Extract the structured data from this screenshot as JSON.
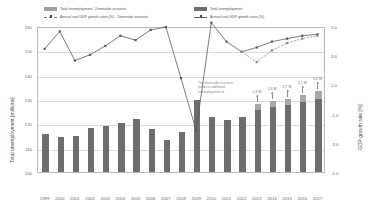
{
  "legend": {
    "left": [
      {
        "key": "bar-light",
        "label": "Total unemployment - Downside scenario"
      },
      {
        "key": "line-dashed",
        "label": "Annual real GDP growth rates (%) - Downside scenario"
      }
    ],
    "right": [
      {
        "key": "bar-dark",
        "label": "Total unemployment"
      },
      {
        "key": "line-solid",
        "label": "Annual real GDP growth rates (%)"
      }
    ]
  },
  "annotation": "The downside scenario predicts additional unemployment of",
  "chart_data": {
    "type": "bar",
    "title": "",
    "xlabel": "",
    "ylabel": "Total unemployment [millions]",
    "y2label": "GDP growth rate [%]",
    "categories": [
      "1999",
      "2000",
      "2001",
      "2002",
      "2003",
      "2004",
      "2005",
      "2006",
      "2007",
      "2008",
      "2009",
      "2010",
      "2011",
      "2012",
      "2013",
      "2014",
      "2015",
      "2016",
      "2017"
    ],
    "ylim": [
      100,
      160
    ],
    "yticks": [
      100,
      110,
      120,
      130,
      140,
      150,
      160
    ],
    "y2lim": [
      -5.0,
      5.0
    ],
    "y2ticks": [
      5.0,
      3.0,
      1.0,
      -1.0,
      -3.0,
      -5.0
    ],
    "grid": true,
    "legend_position": "top",
    "series": [
      {
        "name": "Total unemployment",
        "type": "bar",
        "axis": "left",
        "color": "#6d6d6d",
        "values": [
          115.5,
          114.4,
          114.8,
          118.2,
          119.0,
          120.0,
          121.6,
          117.5,
          113.0,
          116.3,
          129.6,
          122.8,
          121.2,
          122.5,
          126.4,
          127.4,
          128.3,
          129.5,
          130.9
        ]
      },
      {
        "name": "Total unemployment - Downside scenario",
        "type": "bar-increment",
        "axis": "left",
        "color": "#a8a8a8",
        "values": [
          null,
          null,
          null,
          null,
          null,
          null,
          null,
          null,
          null,
          null,
          null,
          null,
          null,
          null,
          2.4,
          2.6,
          2.7,
          3.1,
          3.2
        ]
      },
      {
        "name": "Annual real GDP growth rates (%)",
        "type": "line",
        "axis": "right",
        "color": "#5a5a5a",
        "values": [
          3.5,
          4.7,
          2.7,
          3.1,
          3.7,
          4.4,
          4.1,
          4.8,
          5.0,
          1.5,
          -2.1,
          5.3,
          4.0,
          3.3,
          3.6,
          4.0,
          4.2,
          4.4,
          4.5
        ]
      },
      {
        "name": "Annual real GDP growth rates (%) - Downside scenario",
        "type": "line-dashed",
        "axis": "right",
        "color": "#8a8a8a",
        "values": [
          null,
          null,
          null,
          null,
          null,
          null,
          null,
          null,
          null,
          null,
          null,
          null,
          null,
          3.3,
          2.6,
          3.4,
          3.9,
          4.2,
          4.4
        ]
      }
    ],
    "data_labels": [
      {
        "category": "2013",
        "text": "2.4 M"
      },
      {
        "category": "2014",
        "text": "2.6 M"
      },
      {
        "category": "2015",
        "text": "2.7 M"
      },
      {
        "category": "2016",
        "text": "3.1 M"
      },
      {
        "category": "2017",
        "text": "3.2 M"
      }
    ]
  }
}
